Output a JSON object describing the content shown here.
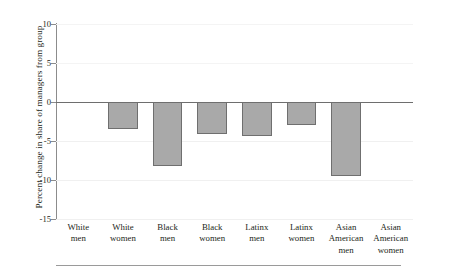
{
  "chart_data": {
    "type": "bar",
    "title": "",
    "subtitle": "",
    "xlabel": "",
    "ylabel": "Percent change in share of managers from group",
    "ylim": [
      -15,
      10
    ],
    "yticks": [
      10,
      5,
      0,
      -5,
      -10,
      -15
    ],
    "ytick_labels": [
      "10",
      "5",
      "0",
      "-5",
      "-10",
      "-15"
    ],
    "grid": true,
    "legend": "none",
    "categories": [
      "White men",
      "White women",
      "Black men",
      "Black women",
      "Latinx men",
      "Latinx women",
      "Asian American men",
      "Asian American women"
    ],
    "category_lines": [
      [
        "White",
        "men"
      ],
      [
        "White",
        "women"
      ],
      [
        "Black",
        "men"
      ],
      [
        "Black",
        "women"
      ],
      [
        "Latinx",
        "men"
      ],
      [
        "Latinx",
        "women"
      ],
      [
        "Asian",
        "American",
        "men"
      ],
      [
        "Asian",
        "American",
        "women"
      ]
    ],
    "values": [
      0,
      -3.4,
      -8.2,
      -4.1,
      -4.3,
      -3.0,
      -9.5,
      0
    ],
    "bar_color": "#a9a9a9",
    "bar_edge_color": "#6f6f6f",
    "zero_line_color": "#6e6e6e",
    "axis_color": "#8c8c8c"
  }
}
